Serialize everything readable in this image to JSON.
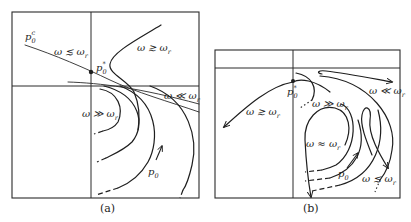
{
  "panels": [
    {
      "id": "a",
      "caption": "(a)",
      "labels": {
        "p0c": "p",
        "p0c_sub": "0",
        "p0c_sup": "c",
        "p0star": "p",
        "p0star_sub": "0",
        "p0star_sup": "*",
        "p0": "p",
        "p0_sub": "0",
        "omega_lesssim": "ω ≲ ω",
        "omega_lesssim_sub": "r",
        "omega_gtrsim": "ω ≳ ω",
        "omega_gtrsim_sub": "r",
        "omega_ll": "ω ≪ ω",
        "omega_ll_sub": "r",
        "omega_gg": "ω ≫ ω",
        "omega_gg_sub": "r"
      }
    },
    {
      "id": "b",
      "caption": "(b)",
      "labels": {
        "p0star": "p",
        "p0star_sub": "0",
        "p0star_sup": "*",
        "p0": "p",
        "p0_sub": "0",
        "omega_gtrsim": "ω ≳ ω",
        "omega_gtrsim_sub": "r",
        "omega_ll": "ω ≪ ω",
        "omega_ll_sub": "r",
        "omega_gg": "ω ≫ ω",
        "omega_gg_sub": "r",
        "omega_approx": "ω ≈ ω",
        "omega_approx_sub": "r",
        "omega_lesssim": "ω ≲ ω",
        "omega_lesssim_sub": "r"
      }
    }
  ],
  "colors": {
    "line": "#1e1e1e",
    "background": "#ffffff"
  }
}
